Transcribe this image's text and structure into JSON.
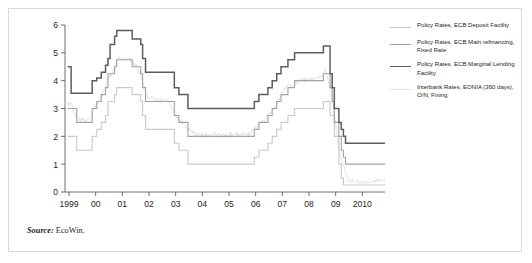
{
  "figure": {
    "source_key": "Source:",
    "source_value": " EcoWin."
  },
  "colors": {
    "axis": "#6f6f6f",
    "text": "#231f20",
    "deposit": "#c9c9c9",
    "main_refi": "#a2a2a2",
    "marginal": "#5d5d5d",
    "eonia": "#e2e2e2",
    "frame": "#d9d9d9"
  },
  "legend": {
    "position": "right",
    "entries": [
      {
        "label": "Policy Rates, ECB Deposit Facility",
        "color": "#c9c9c9",
        "width": 1.1
      },
      {
        "label": "Policy Rates, ECB Main refinancing, Fixed Rate",
        "color": "#a2a2a2",
        "width": 1.1
      },
      {
        "label": "Policy Rates, ECB Marginal Lending Facility",
        "color": "#5d5d5d",
        "width": 1.5
      },
      {
        "label": "Interbank Rates, EONIA (360 days), O/N, Fixing",
        "color": "#e2e2e2",
        "width": 1.0
      }
    ]
  },
  "chart_data": {
    "type": "line",
    "title": "",
    "xlabel": "",
    "ylabel": "",
    "grid": false,
    "step_style": "post",
    "xlim": [
      1998.85,
      2010.85
    ],
    "ylim": [
      0,
      6
    ],
    "yticks": [
      0,
      1,
      2,
      3,
      4,
      5,
      6
    ],
    "ytick_labels": [
      "0",
      "1",
      "2",
      "3",
      "4",
      "5",
      "6"
    ],
    "xticks": [
      1999,
      2000,
      2001,
      2002,
      2003,
      2004,
      2005,
      2006,
      2007,
      2008,
      2009,
      2010
    ],
    "xtick_labels": [
      "1999",
      "00",
      "01",
      "02",
      "03",
      "04",
      "05",
      "06",
      "07",
      "08",
      "09",
      "2010"
    ],
    "series": [
      {
        "name": "Policy Rates, ECB Marginal Lending Facility",
        "color": "#5d5d5d",
        "width": 1.5,
        "points": [
          [
            1998.95,
            4.5
          ],
          [
            1999.06,
            4.5
          ],
          [
            1999.08,
            3.55
          ],
          [
            1999.84,
            3.55
          ],
          [
            1999.87,
            4.0
          ],
          [
            2000.04,
            4.1
          ],
          [
            2000.21,
            4.3
          ],
          [
            2000.37,
            4.55
          ],
          [
            2000.46,
            4.8
          ],
          [
            2000.54,
            5.3
          ],
          [
            2000.71,
            5.6
          ],
          [
            2000.79,
            5.8
          ],
          [
            2001.37,
            5.5
          ],
          [
            2001.69,
            5.3
          ],
          [
            2001.76,
            4.8
          ],
          [
            2001.87,
            4.3
          ],
          [
            2002.95,
            3.75
          ],
          [
            2003.12,
            3.5
          ],
          [
            2003.46,
            3.0
          ],
          [
            2005.95,
            3.25
          ],
          [
            2006.12,
            3.5
          ],
          [
            2006.46,
            3.75
          ],
          [
            2006.62,
            4.0
          ],
          [
            2006.79,
            4.25
          ],
          [
            2006.95,
            4.5
          ],
          [
            2007.21,
            4.75
          ],
          [
            2007.46,
            5.0
          ],
          [
            2008.54,
            5.25
          ],
          [
            2008.79,
            4.25
          ],
          [
            2008.87,
            3.75
          ],
          [
            2008.95,
            3.0
          ],
          [
            2009.12,
            2.5
          ],
          [
            2009.21,
            2.25
          ],
          [
            2009.29,
            2.0
          ],
          [
            2009.37,
            1.75
          ],
          [
            2010.85,
            1.75
          ]
        ]
      },
      {
        "name": "Policy Rates, ECB Main refinancing, Fixed Rate",
        "color": "#a2a2a2",
        "width": 1.1,
        "points": [
          [
            1998.95,
            3.0
          ],
          [
            1999.21,
            3.0
          ],
          [
            1999.29,
            2.5
          ],
          [
            1999.84,
            2.5
          ],
          [
            1999.87,
            3.0
          ],
          [
            2000.04,
            3.25
          ],
          [
            2000.21,
            3.5
          ],
          [
            2000.37,
            3.75
          ],
          [
            2000.46,
            4.25
          ],
          [
            2000.71,
            4.5
          ],
          [
            2000.79,
            4.75
          ],
          [
            2001.37,
            4.5
          ],
          [
            2001.69,
            4.25
          ],
          [
            2001.76,
            3.75
          ],
          [
            2001.87,
            3.25
          ],
          [
            2002.95,
            2.75
          ],
          [
            2003.12,
            2.5
          ],
          [
            2003.46,
            2.0
          ],
          [
            2005.95,
            2.25
          ],
          [
            2006.12,
            2.5
          ],
          [
            2006.46,
            2.75
          ],
          [
            2006.62,
            3.0
          ],
          [
            2006.79,
            3.25
          ],
          [
            2006.95,
            3.5
          ],
          [
            2007.21,
            3.75
          ],
          [
            2007.46,
            4.0
          ],
          [
            2008.54,
            4.25
          ],
          [
            2008.79,
            3.75
          ],
          [
            2008.87,
            3.25
          ],
          [
            2008.95,
            2.5
          ],
          [
            2009.12,
            2.0
          ],
          [
            2009.21,
            1.5
          ],
          [
            2009.29,
            1.25
          ],
          [
            2009.37,
            1.0
          ],
          [
            2010.85,
            1.0
          ]
        ]
      },
      {
        "name": "Policy Rates, ECB Deposit Facility",
        "color": "#c9c9c9",
        "width": 1.1,
        "points": [
          [
            1998.95,
            2.0
          ],
          [
            1999.21,
            2.0
          ],
          [
            1999.29,
            1.5
          ],
          [
            1999.84,
            1.5
          ],
          [
            1999.87,
            2.0
          ],
          [
            2000.04,
            2.25
          ],
          [
            2000.21,
            2.5
          ],
          [
            2000.37,
            2.75
          ],
          [
            2000.46,
            3.25
          ],
          [
            2000.71,
            3.5
          ],
          [
            2000.79,
            3.75
          ],
          [
            2001.37,
            3.5
          ],
          [
            2001.69,
            3.25
          ],
          [
            2001.76,
            2.75
          ],
          [
            2001.87,
            2.25
          ],
          [
            2002.95,
            1.75
          ],
          [
            2003.12,
            1.5
          ],
          [
            2003.46,
            1.0
          ],
          [
            2005.95,
            1.25
          ],
          [
            2006.12,
            1.5
          ],
          [
            2006.46,
            1.75
          ],
          [
            2006.62,
            2.0
          ],
          [
            2006.79,
            2.25
          ],
          [
            2006.95,
            2.5
          ],
          [
            2007.21,
            2.75
          ],
          [
            2007.46,
            3.0
          ],
          [
            2008.54,
            3.25
          ],
          [
            2008.79,
            2.75
          ],
          [
            2008.87,
            2.75
          ],
          [
            2008.95,
            2.0
          ],
          [
            2009.12,
            1.0
          ],
          [
            2009.21,
            0.5
          ],
          [
            2009.29,
            0.25
          ],
          [
            2010.85,
            0.25
          ]
        ]
      },
      {
        "name": "Interbank Rates, EONIA (360 days), O/N, Fixing",
        "color": "#e2e2e2",
        "width": 1.0,
        "noisy": true,
        "points": [
          [
            1998.95,
            3.2
          ],
          [
            1999.1,
            3.1
          ],
          [
            1999.25,
            2.7
          ],
          [
            1999.5,
            2.55
          ],
          [
            1999.8,
            2.6
          ],
          [
            1999.95,
            3.05
          ],
          [
            2000.2,
            3.4
          ],
          [
            2000.45,
            3.95
          ],
          [
            2000.7,
            4.45
          ],
          [
            2000.85,
            4.8
          ],
          [
            2001.2,
            4.78
          ],
          [
            2001.5,
            4.55
          ],
          [
            2001.75,
            4.0
          ],
          [
            2001.95,
            3.4
          ],
          [
            2002.3,
            3.3
          ],
          [
            2002.7,
            3.3
          ],
          [
            2003.0,
            2.75
          ],
          [
            2003.4,
            2.3
          ],
          [
            2003.8,
            2.05
          ],
          [
            2004.3,
            2.05
          ],
          [
            2004.8,
            2.05
          ],
          [
            2005.3,
            2.07
          ],
          [
            2005.8,
            2.1
          ],
          [
            2006.05,
            2.4
          ],
          [
            2006.4,
            2.65
          ],
          [
            2006.7,
            3.0
          ],
          [
            2007.0,
            3.6
          ],
          [
            2007.3,
            3.85
          ],
          [
            2007.7,
            4.0
          ],
          [
            2008.0,
            4.05
          ],
          [
            2008.45,
            4.1
          ],
          [
            2008.6,
            4.4
          ],
          [
            2008.75,
            3.9
          ],
          [
            2008.9,
            3.2
          ],
          [
            2009.0,
            2.4
          ],
          [
            2009.15,
            1.4
          ],
          [
            2009.3,
            0.9
          ],
          [
            2009.5,
            0.4
          ],
          [
            2009.8,
            0.35
          ],
          [
            2010.2,
            0.33
          ],
          [
            2010.6,
            0.4
          ],
          [
            2010.85,
            0.45
          ]
        ]
      }
    ]
  }
}
